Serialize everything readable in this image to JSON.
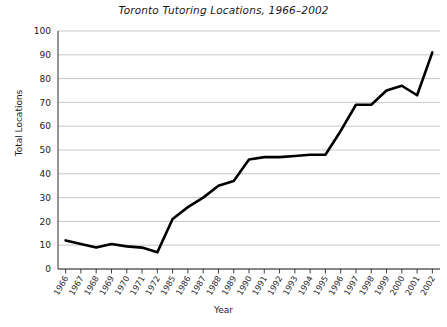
{
  "chart_data": {
    "type": "line",
    "title": "Toronto Tutoring Locations, 1966–2002",
    "xlabel": "Year",
    "ylabel": "Total Locations",
    "grid": "horizontal",
    "legend": "none",
    "ylim": [
      0,
      100
    ],
    "yticks": [
      0,
      10,
      20,
      30,
      40,
      50,
      60,
      70,
      80,
      90,
      100
    ],
    "categories": [
      "1966",
      "1967",
      "1968",
      "1969",
      "1970",
      "1971",
      "1972",
      "1985",
      "1986",
      "1987",
      "1988",
      "1989",
      "1990",
      "1991",
      "1992",
      "1993",
      "1994",
      "1995",
      "1996",
      "1997",
      "1998",
      "1999",
      "2000",
      "2001",
      "2002"
    ],
    "values": [
      12,
      10.5,
      9,
      10.5,
      9.5,
      9,
      7,
      21,
      26,
      30,
      35,
      37,
      46,
      47,
      47,
      47.5,
      48,
      48,
      58,
      69,
      69,
      75,
      77,
      73,
      91
    ]
  }
}
